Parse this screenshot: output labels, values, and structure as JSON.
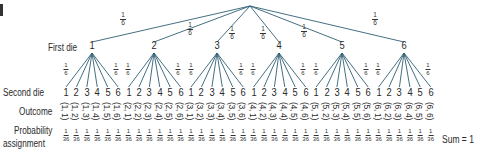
{
  "diagram": {
    "corner_mark": "5",
    "row_labels": {
      "first_die": "First die",
      "second_die": "Second die",
      "outcome": "Outcome",
      "probability_line1": "Probability",
      "probability_line2": "assignment"
    },
    "first_die_branch_prob": {
      "num": "1",
      "den": "6"
    },
    "first_die_values": [
      "1",
      "2",
      "3",
      "4",
      "5",
      "6"
    ],
    "second_die_values": [
      "1",
      "2",
      "3",
      "4",
      "5",
      "6"
    ],
    "second_die_branch_prob": {
      "num": "1",
      "den": "6"
    },
    "outcome_prob": {
      "num": "1",
      "den": "36"
    },
    "outcomes": [
      "(1, 1)",
      "(1, 2)",
      "(1, 3)",
      "(1, 4)",
      "(1, 5)",
      "(1, 6)",
      "(2, 1)",
      "(2, 2)",
      "(2, 3)",
      "(2, 4)",
      "(2, 5)",
      "(2, 6)",
      "(3, 1)",
      "(3, 2)",
      "(3, 3)",
      "(3, 4)",
      "(3, 5)",
      "(3, 6)",
      "(4, 1)",
      "(4, 2)",
      "(4, 3)",
      "(4, 4)",
      "(4, 5)",
      "(4, 6)",
      "(5, 1)",
      "(5, 2)",
      "(5, 3)",
      "(5, 4)",
      "(5, 5)",
      "(5, 6)",
      "(6, 1)",
      "(6, 2)",
      "(6, 3)",
      "(6, 4)",
      "(6, 5)",
      "(6, 6)"
    ],
    "sum_label": "Sum = 1",
    "colors": {
      "line": "#2f5f73",
      "text": "#2a2a2a"
    }
  }
}
